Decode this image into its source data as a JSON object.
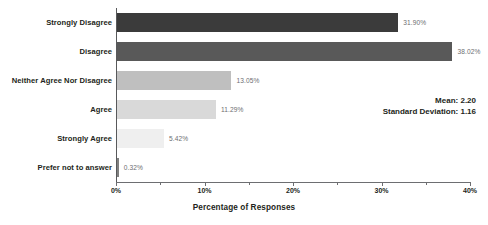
{
  "chart_data": {
    "type": "bar",
    "orientation": "horizontal",
    "title": "",
    "xlabel": "Percentage of Responses",
    "ylabel": "",
    "xlim": [
      0,
      40
    ],
    "grid": false,
    "legend": "none",
    "categories": [
      "Strongly Disagree",
      "Disagree",
      "Neither Agree Nor Disagree",
      "Agree",
      "Strongly Agree",
      "Prefer not to answer"
    ],
    "values": [
      31.9,
      38.02,
      13.05,
      11.29,
      5.42,
      0.32
    ],
    "value_labels": [
      "31.90%",
      "38.02%",
      "13.05%",
      "11.29%",
      "5.42%",
      "0.32%"
    ],
    "bar_colors": [
      "#3b3b3b",
      "#595959",
      "#bfbfbf",
      "#d9d9d9",
      "#efefef",
      "#7f7f7f"
    ],
    "x_tick_labels": [
      "0%",
      "10%",
      "20%",
      "30%",
      "40%"
    ],
    "x_tick_values": [
      0,
      10,
      20,
      30,
      40
    ],
    "x_minor_tick_values": [
      5,
      15,
      25,
      35
    ],
    "annotations": {
      "mean_label": "Mean: 2.20",
      "std_label": "Standard Deviation: 1.16"
    }
  }
}
